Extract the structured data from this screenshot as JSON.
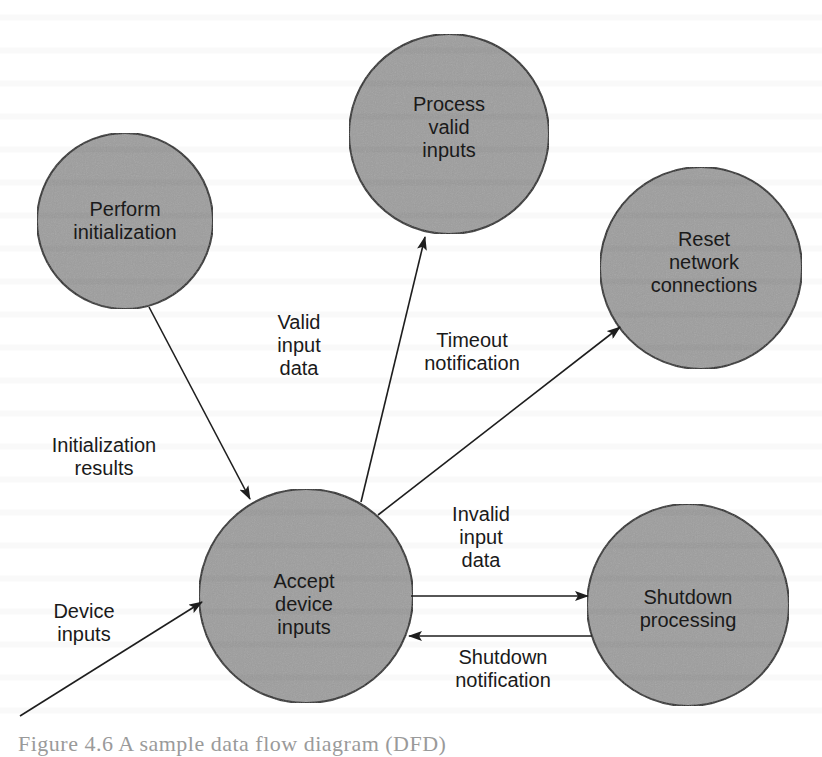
{
  "colors": {
    "bubble_fill": "#9e9e9e",
    "bubble_stroke": "#2a2a2a",
    "line": "#1e1e1e",
    "text": "#1a1a1a",
    "background": "#ffffff"
  },
  "processes": [
    {
      "id": "perform-initialization",
      "lines": [
        "Perform",
        "initialization"
      ],
      "cx": 125,
      "cy": 221,
      "r": 88
    },
    {
      "id": "process-valid-inputs",
      "lines": [
        "Process",
        "valid",
        "inputs"
      ],
      "cx": 449,
      "cy": 134,
      "r": 100
    },
    {
      "id": "reset-network-connections",
      "lines": [
        "Reset",
        "network",
        "connections"
      ],
      "cx": 701,
      "cy": 268,
      "r": 101
    },
    {
      "id": "accept-device-inputs",
      "lines": [
        "Accept",
        "device",
        "inputs"
      ],
      "cx": 306,
      "cy": 596,
      "r": 107
    },
    {
      "id": "shutdown-processing",
      "lines": [
        "Shutdown",
        "processing"
      ],
      "cx": 688,
      "cy": 605,
      "r": 101
    }
  ],
  "flows": [
    {
      "id": "initialization-results",
      "from": "perform-initialization",
      "to": "accept-device-inputs",
      "lines": [
        "Initialization",
        "results"
      ]
    },
    {
      "id": "valid-input-data",
      "from": "accept-device-inputs",
      "to": "process-valid-inputs",
      "lines": [
        "Valid",
        "input",
        "data"
      ]
    },
    {
      "id": "timeout-notification",
      "from": "accept-device-inputs",
      "to": "reset-network-connections",
      "lines": [
        "Timeout",
        "notification"
      ]
    },
    {
      "id": "invalid-input-data",
      "from": "accept-device-inputs",
      "to": "shutdown-processing",
      "lines": [
        "Invalid",
        "input",
        "data"
      ]
    },
    {
      "id": "shutdown-notification",
      "from": "shutdown-processing",
      "to": "accept-device-inputs",
      "lines": [
        "Shutdown",
        "notification"
      ]
    },
    {
      "id": "device-inputs",
      "from": "external",
      "to": "accept-device-inputs",
      "lines": [
        "Device",
        "inputs"
      ]
    }
  ],
  "caption": "Figure 4.6  A sample data flow diagram (DFD)"
}
